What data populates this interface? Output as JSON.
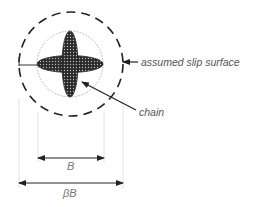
{
  "diagram": {
    "labels": {
      "slip_surface": "assumed slip surface",
      "chain": "chain",
      "inner_width": "B",
      "outer_width": "βB"
    },
    "colors": {
      "line": "#222222",
      "chain_fill": "#333333",
      "extension_line": "#dddddd",
      "inner_circle": "#999999",
      "text": "#555555"
    }
  }
}
